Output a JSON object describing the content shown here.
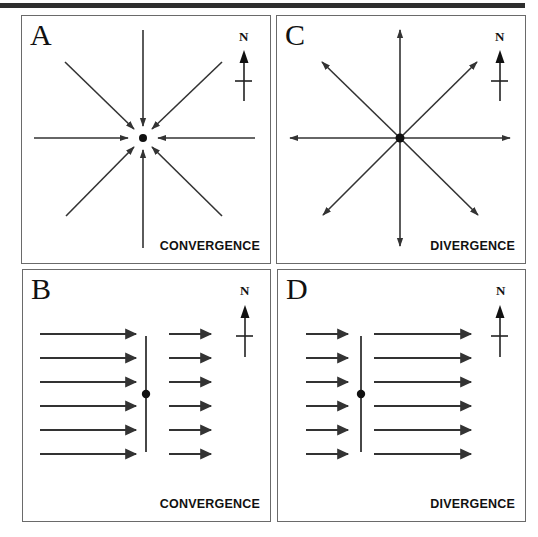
{
  "figure": {
    "panels": [
      {
        "id": "A",
        "letter": "A",
        "caption": "CONVERGENCE",
        "pattern": "radial-inward",
        "north_label": "N"
      },
      {
        "id": "C",
        "letter": "C",
        "caption": "DIVERGENCE",
        "pattern": "radial-outward",
        "north_label": "N"
      },
      {
        "id": "B",
        "letter": "B",
        "caption": "CONVERGENCE",
        "pattern": "parallel-flow-slowing",
        "north_label": "N"
      },
      {
        "id": "D",
        "letter": "D",
        "caption": "DIVERGENCE",
        "pattern": "parallel-flow-accelerating",
        "north_label": "N"
      }
    ],
    "colors": {
      "line": "#333333",
      "border": "#6a6a6a",
      "topbar": "#2e2e2e",
      "text": "#111111"
    }
  }
}
